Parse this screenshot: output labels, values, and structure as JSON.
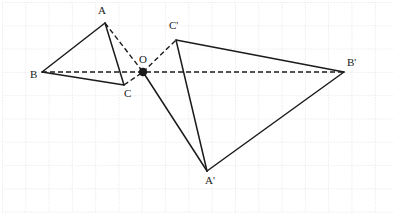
{
  "figure": {
    "canvas": {
      "width": 396,
      "height": 215
    },
    "background_color": "#ffffff",
    "stroke_color": "#1b1b1b",
    "grid": {
      "visible": true,
      "spacing_px": 23.3,
      "origin_x": 2,
      "origin_y": 2,
      "color": "#d8d8e0",
      "style": "dotted",
      "cols": 17,
      "rows": 9
    },
    "points": [
      {
        "id": "A",
        "label": "A",
        "x": 105,
        "y": 23,
        "label_x": 98,
        "label_y": 14,
        "dot": false
      },
      {
        "id": "B",
        "label": "B",
        "x": 42,
        "y": 72,
        "label_x": 30,
        "label_y": 78,
        "dot": false
      },
      {
        "id": "C",
        "label": "C",
        "x": 124,
        "y": 85,
        "label_x": 124,
        "label_y": 97,
        "dot": false
      },
      {
        "id": "O",
        "label": "O",
        "x": 143,
        "y": 72,
        "label_x": 139,
        "label_y": 63,
        "dot": true
      },
      {
        "id": "Ap",
        "label": "A'",
        "x": 207,
        "y": 171,
        "label_x": 205,
        "label_y": 184,
        "dot": false
      },
      {
        "id": "Bp",
        "label": "B'",
        "x": 344,
        "y": 72,
        "label_x": 347,
        "label_y": 66,
        "dot": false
      },
      {
        "id": "Cp",
        "label": "C'",
        "x": 176,
        "y": 40,
        "label_x": 169,
        "label_y": 29,
        "dot": false
      }
    ],
    "solid_segments": [
      {
        "name": "segment-AB",
        "x1": 105,
        "y1": 23,
        "x2": 42,
        "y2": 72
      },
      {
        "name": "segment-BC",
        "x1": 42,
        "y1": 72,
        "x2": 124,
        "y2": 85
      },
      {
        "name": "segment-AC",
        "x1": 105,
        "y1": 23,
        "x2": 124,
        "y2": 85
      },
      {
        "name": "segment-CpBp",
        "x1": 176,
        "y1": 40,
        "x2": 344,
        "y2": 72
      },
      {
        "name": "segment-BpAp",
        "x1": 344,
        "y1": 72,
        "x2": 207,
        "y2": 171
      },
      {
        "name": "segment-CpAp",
        "x1": 176,
        "y1": 40,
        "x2": 207,
        "y2": 171
      },
      {
        "name": "segment-O-Ap",
        "x1": 143,
        "y1": 72,
        "x2": 207,
        "y2": 171
      }
    ],
    "dashed_segments": [
      {
        "name": "ray-B-O-Bp",
        "x1": 42,
        "y1": 72,
        "x2": 344,
        "y2": 72
      },
      {
        "name": "ray-A-O",
        "x1": 105,
        "y1": 23,
        "x2": 143,
        "y2": 72
      },
      {
        "name": "ray-O-Cp",
        "x1": 143,
        "y1": 72,
        "x2": 176,
        "y2": 40
      },
      {
        "name": "ray-C-O",
        "x1": 124,
        "y1": 85,
        "x2": 143,
        "y2": 72
      }
    ],
    "dot_radius": 4.2,
    "solid_width": 1.5,
    "dashed_width": 1.4,
    "dash_pattern": "5,3"
  }
}
